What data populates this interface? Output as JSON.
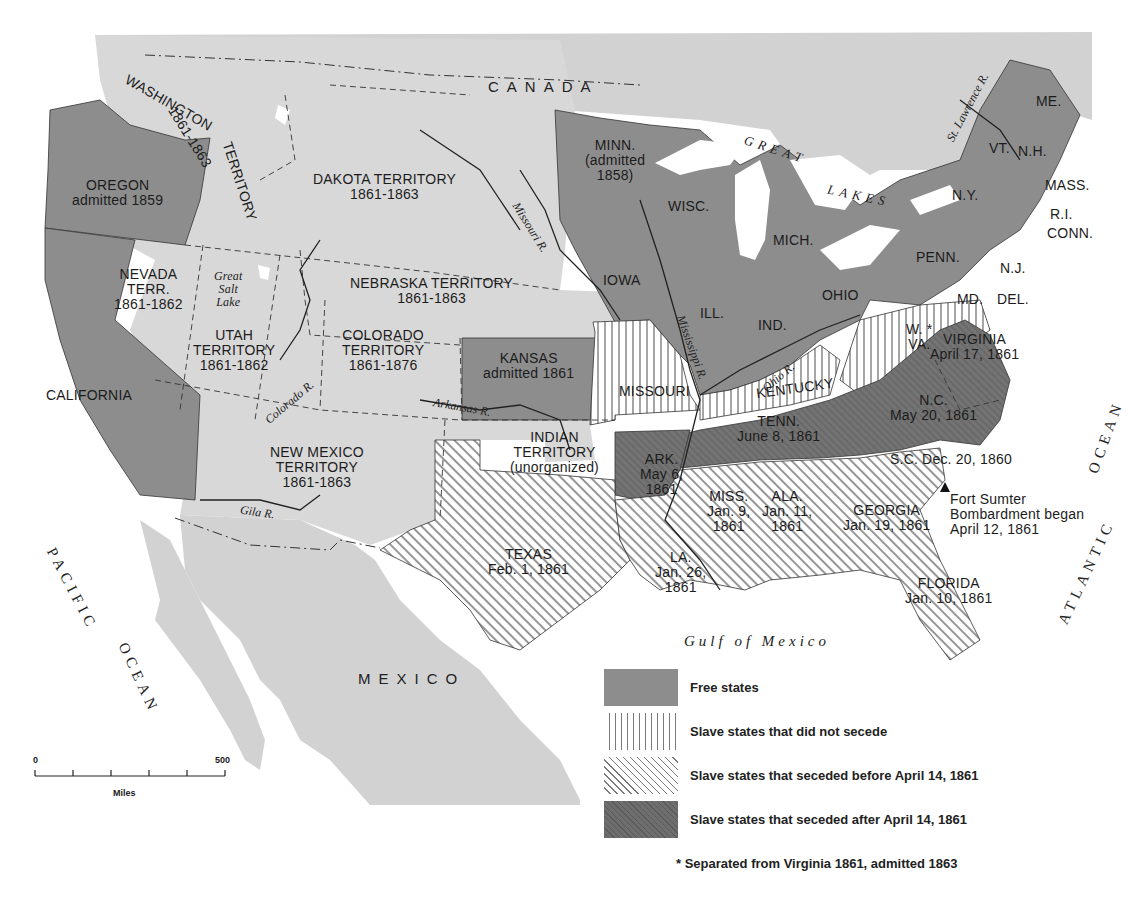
{
  "map": {
    "title": "The United States on the Eve of the Civil War, 1861",
    "colors": {
      "background": "#ffffff",
      "foreign_land": "#cfcfcf",
      "territory": "#d6d6d6",
      "free_state": "#8f8f8f",
      "seceded_after": "#6f6f6f",
      "hatch_line": "#555555",
      "water": "#ffffff"
    },
    "countries": {
      "canada": "CANADA",
      "mexico": "MEXICO"
    },
    "water_bodies": {
      "pacific_1": "PACIFIC",
      "pacific_2": "OCEAN",
      "atlantic_1": "ATLANTIC",
      "atlantic_2": "OCEAN",
      "gulf": "Gulf of Mexico",
      "great_lakes_1": "GREAT",
      "great_lakes_2": "LAKES",
      "great_salt_lake": [
        "Great",
        "Salt",
        "Lake"
      ]
    },
    "rivers": {
      "missouri": "Missouri R.",
      "mississippi": "Mississippi R.",
      "ohio": "Ohio R.",
      "arkansas": "Arkansas R.",
      "colorado": "Colorado R.",
      "gila": "Gila R.",
      "st_lawrence": "St. Lawrence R."
    },
    "regions": {
      "washington": {
        "name": "WASHINGTON",
        "suffix": "TERRITORY",
        "dates": "1861-1863",
        "status": "territory"
      },
      "oregon": {
        "name": "OREGON",
        "note": "admitted 1859",
        "status": "free"
      },
      "california": {
        "name": "CALIFORNIA",
        "status": "free"
      },
      "nevada": {
        "name": "NEVADA",
        "line2": "TERR.",
        "dates": "1861-1862",
        "status": "territory"
      },
      "utah": {
        "name": "UTAH",
        "line2": "TERRITORY",
        "dates": "1861-1862",
        "status": "territory"
      },
      "dakota": {
        "name": "DAKOTA TERRITORY",
        "dates": "1861-1863",
        "status": "territory"
      },
      "nebraska": {
        "name": "NEBRASKA TERRITORY",
        "dates": "1861-1863",
        "status": "territory"
      },
      "colorado": {
        "name": "COLORADO",
        "line2": "TERRITORY",
        "dates": "1861-1876",
        "status": "territory"
      },
      "new_mexico": {
        "name": "NEW MEXICO",
        "line2": "TERRITORY",
        "dates": "1861-1863",
        "status": "territory"
      },
      "kansas": {
        "name": "KANSAS",
        "note": "admitted 1861",
        "status": "free"
      },
      "indian": {
        "name": "INDIAN",
        "line2": "TERRITORY",
        "note": "(unorganized)",
        "status": "territory"
      },
      "minnesota": {
        "name": "MINN.",
        "note": "(admitted",
        "note2": "1858)",
        "status": "free"
      },
      "iowa": {
        "name": "IOWA",
        "status": "free"
      },
      "wisconsin": {
        "name": "WISC.",
        "status": "free"
      },
      "illinois": {
        "name": "ILL.",
        "status": "free"
      },
      "indiana": {
        "name": "IND.",
        "status": "free"
      },
      "michigan": {
        "name": "MICH.",
        "status": "free"
      },
      "ohio": {
        "name": "OHIO",
        "status": "free"
      },
      "pennsylvania": {
        "name": "PENN.",
        "status": "free"
      },
      "new_york": {
        "name": "N.Y.",
        "status": "free"
      },
      "new_jersey": {
        "name": "N.J.",
        "status": "free"
      },
      "vermont": {
        "name": "VT.",
        "status": "free"
      },
      "new_hampshire": {
        "name": "N.H.",
        "status": "free"
      },
      "maine": {
        "name": "ME.",
        "status": "free"
      },
      "massachusetts": {
        "name": "MASS.",
        "status": "free"
      },
      "rhode_island": {
        "name": "R.I.",
        "status": "free"
      },
      "connecticut": {
        "name": "CONN.",
        "status": "free"
      },
      "missouri": {
        "name": "MISSOURI",
        "status": "slave_not_seceded"
      },
      "kentucky": {
        "name": "KENTUCKY",
        "status": "slave_not_seceded"
      },
      "maryland": {
        "name": "MD.",
        "status": "slave_not_seceded"
      },
      "delaware": {
        "name": "DEL.",
        "status": "slave_not_seceded"
      },
      "west_virginia": {
        "name": "W.",
        "line2": "VA.",
        "marker": "*",
        "status": "slave_not_seceded"
      },
      "virginia": {
        "name": "VIRGINIA",
        "date": "April 17, 1861",
        "status": "seceded_after"
      },
      "north_carolina": {
        "name": "N.C.",
        "date": "May 20, 1861",
        "status": "seceded_after"
      },
      "tennessee": {
        "name": "TENN.",
        "date": "June 8, 1861",
        "status": "seceded_after"
      },
      "arkansas": {
        "name": "ARK.",
        "date": "May 6,",
        "date2": "1861",
        "status": "seceded_after"
      },
      "south_carolina": {
        "name": "S.C. Dec. 20, 1860",
        "status": "seceded_before"
      },
      "georgia": {
        "name": "GEORGIA",
        "date": "Jan. 19, 1861",
        "status": "seceded_before"
      },
      "florida": {
        "name": "FLORIDA",
        "date": "Jan. 10, 1861",
        "status": "seceded_before"
      },
      "alabama": {
        "name": "ALA.",
        "date": "Jan. 11,",
        "date2": "1861",
        "status": "seceded_before"
      },
      "mississippi": {
        "name": "MISS.",
        "date": "Jan. 9,",
        "date2": "1861",
        "status": "seceded_before"
      },
      "louisiana": {
        "name": "LA.",
        "date": "Jan. 26,",
        "date2": "1861",
        "status": "seceded_before"
      },
      "texas": {
        "name": "TEXAS",
        "date": "Feb. 1, 1861",
        "status": "seceded_before"
      }
    },
    "annotations": {
      "fort_sumter": {
        "marker": "triangle-icon",
        "line1": "Fort Sumter",
        "line2": "Bombardment began",
        "line3": "April 12, 1861"
      }
    },
    "legend": {
      "items": [
        {
          "key": "free",
          "label": "Free states"
        },
        {
          "key": "slave_not_seceded",
          "label": "Slave states that did not secede"
        },
        {
          "key": "seceded_before",
          "label": "Slave states that seceded before April 14, 1861"
        },
        {
          "key": "seceded_after",
          "label": "Slave states that seceded after April 14, 1861"
        }
      ],
      "footnote": "*  Separated from Virginia 1861, admitted 1863"
    },
    "scale_bar": {
      "start": "0",
      "end": "500",
      "units": "Miles",
      "ticks": 6
    }
  }
}
